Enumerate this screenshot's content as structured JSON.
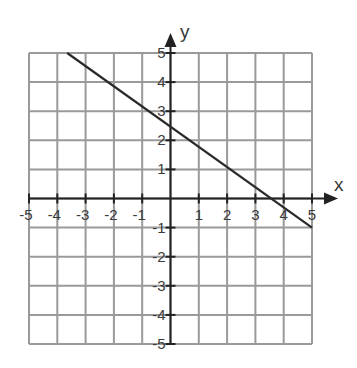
{
  "chart_data": {
    "type": "line",
    "title": "",
    "xlabel": "x",
    "ylabel": "y",
    "xlim": [
      -5,
      5
    ],
    "ylim": [
      -5,
      5
    ],
    "grid": true,
    "x_ticks": [
      -5,
      -4,
      -3,
      -2,
      -1,
      1,
      2,
      3,
      4,
      5
    ],
    "y_ticks": [
      5,
      4,
      3,
      2,
      1,
      -1,
      -2,
      -3,
      -4,
      -5
    ],
    "x_tick_labels": [
      "-5",
      "-4",
      "-3",
      "-2",
      "-1",
      "1",
      "2",
      "3",
      "4",
      "5"
    ],
    "y_tick_labels": [
      "5",
      "4",
      "3",
      "2",
      "1",
      "-1",
      "-2",
      "-3",
      "-4",
      "-5"
    ],
    "series": [
      {
        "name": "line",
        "x": [
          -3.65,
          5
        ],
        "y": [
          5,
          -1
        ],
        "slope": -0.69,
        "y_intercept": 2.5,
        "x_intercept": 3.65
      }
    ],
    "legend": null
  },
  "colors": {
    "grid": "#9a9a9a",
    "axis": "#222222",
    "line": "#2a2a2a",
    "label": "#3a3a3a"
  },
  "layout": {
    "plot_left": 29,
    "plot_right": 312,
    "plot_top": 53,
    "plot_bottom": 344,
    "x_arrow_tip": 338,
    "y_arrow_tip": 33
  }
}
